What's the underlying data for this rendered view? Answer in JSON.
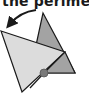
{
  "caption": "the perimet",
  "colors": {
    "dark_triangle": "#a3a3a3",
    "light_triangle": "#dcdcdc",
    "stroke": "#1a1a1a",
    "pivot_point": "#7a7a7a"
  },
  "diagram": {
    "arrow": "curved-rotation-arrow",
    "shapes": [
      "original-triangle",
      "rotated-triangle",
      "pivot-point"
    ]
  }
}
